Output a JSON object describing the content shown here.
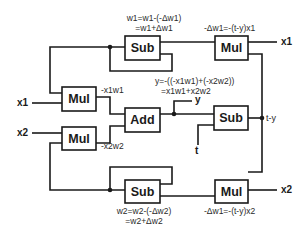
{
  "blocks": {
    "sub_w1": "Sub",
    "mul_dw1": "Mul",
    "mul_x1": "Mul",
    "add": "Add",
    "mul_x2": "Mul",
    "sub_ty": "Sub",
    "sub_w2": "Sub",
    "mul_dw2": "Mul"
  },
  "io": {
    "x1_in": "x1",
    "x2_in": "x2",
    "x1_out": "x1",
    "x2_out": "x2",
    "y": "y",
    "t": "t",
    "t_minus_y": "t-y"
  },
  "labels": {
    "w1_update_line1": "w1=w1-(-Δw1)",
    "w1_update_line2": "=w1+Δw1",
    "dw1": "-Δw1=-(t-y)x1",
    "neg_x1w1": "-x1w1",
    "neg_x2w2": "-x2w2",
    "y_line1": "y=-((-x1w1)+(-x2w2))",
    "y_line2": "=x1w1+x2w2",
    "w2_update_line1": "w2=w2-(-Δw2)",
    "w2_update_line2": "=w2+Δw2",
    "dw2": "-Δw1=-(t-y)x2"
  }
}
